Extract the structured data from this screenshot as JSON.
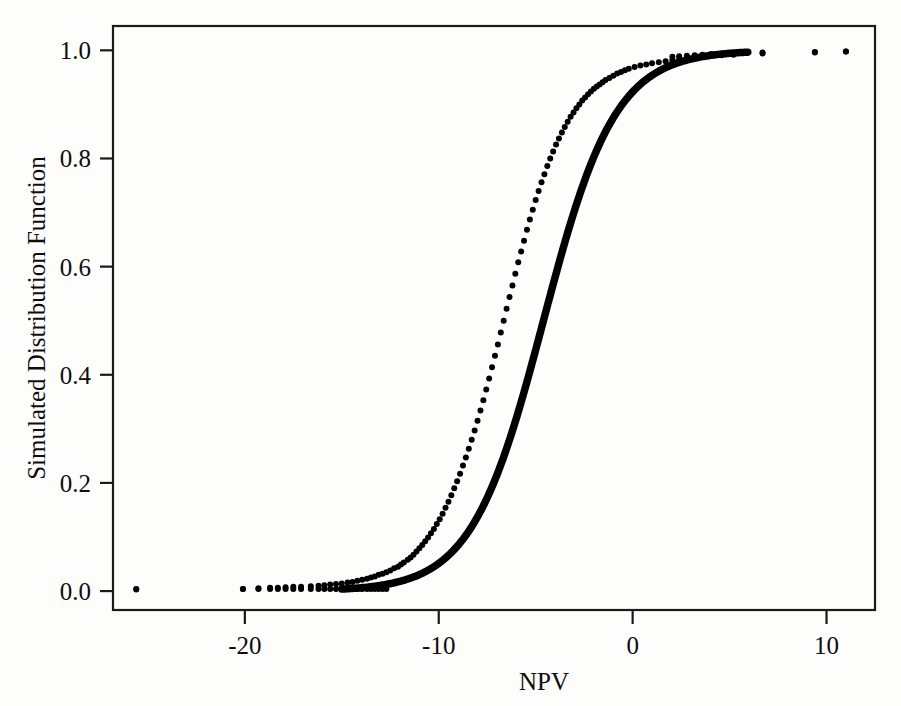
{
  "figure": {
    "background_color": "#fdfdfc",
    "ink_color": "#000000"
  },
  "chart_data": {
    "type": "scatter",
    "title": "",
    "subtitle": "",
    "xlabel": "NPV",
    "ylabel": "Simulated Distribution Function",
    "xlim": [
      -26.8,
      12.5
    ],
    "ylim": [
      -0.035,
      1.045
    ],
    "xticks": [
      -20,
      -10,
      0,
      10
    ],
    "xticklabels": [
      "-20",
      "-10",
      "0",
      "10"
    ],
    "yticks": [
      0.0,
      0.2,
      0.4,
      0.6,
      0.8,
      1.0
    ],
    "yticklabels": [
      "0.0",
      "0.2",
      "0.4",
      "0.6",
      "0.8",
      "1.0"
    ],
    "grid": false,
    "legend": null,
    "annotations": [],
    "marker": "dot",
    "marker_size_px": 6,
    "n_points_approx": 1000,
    "midpoint_npv": -4.6,
    "scale_npv": 1.85,
    "x": [
      -25.6,
      -20.1,
      -19.3,
      -18.7,
      -18.3,
      -17.9,
      -17.5,
      -17.1,
      -16.6,
      -16.2,
      -15.9,
      -15.6,
      -15.3,
      -15.0,
      -14.7,
      -14.45,
      -14.2,
      -13.95,
      -13.7,
      -13.5,
      -13.3,
      -13.1,
      -12.9,
      -12.7,
      -12.5,
      -12.3,
      -12.1,
      -11.95,
      -11.8,
      -11.6,
      -11.45,
      -11.3,
      -11.15,
      -11.0,
      -10.85,
      -10.7,
      -10.55,
      -10.4,
      -10.25,
      -10.1,
      -9.95,
      -9.8,
      -9.65,
      -9.5,
      -9.35,
      -9.2,
      -9.05,
      -8.9,
      -8.75,
      -8.6,
      -8.45,
      -8.3,
      -8.15,
      -8.0,
      -7.85,
      -7.7,
      -7.55,
      -7.4,
      -7.25,
      -7.1,
      -6.95,
      -6.8,
      -6.65,
      -6.5,
      -6.35,
      -6.2,
      -6.05,
      -5.9,
      -5.75,
      -5.6,
      -5.45,
      -5.3,
      -5.15,
      -5.0,
      -4.85,
      -4.7,
      -4.55,
      -4.4,
      -4.25,
      -4.1,
      -3.95,
      -3.8,
      -3.65,
      -3.5,
      -3.35,
      -3.2,
      -3.05,
      -2.9,
      -2.75,
      -2.6,
      -2.45,
      -2.3,
      -2.15,
      -2.0,
      -1.85,
      -1.7,
      -1.55,
      -1.4,
      -1.2,
      -1.0,
      -0.8,
      -0.6,
      -0.4,
      -0.2,
      0.1,
      0.4,
      0.7,
      1.0,
      1.35,
      1.7,
      2.05,
      2.4,
      2.8,
      3.2,
      3.6,
      4.05,
      4.6,
      5.2,
      6.7,
      9.4,
      11.0
    ],
    "y": [
      0.003,
      0.004,
      0.005,
      0.006,
      0.006,
      0.007,
      0.008,
      0.008,
      0.009,
      0.01,
      0.011,
      0.012,
      0.013,
      0.014,
      0.016,
      0.017,
      0.019,
      0.021,
      0.023,
      0.025,
      0.027,
      0.03,
      0.032,
      0.035,
      0.038,
      0.042,
      0.045,
      0.049,
      0.053,
      0.058,
      0.062,
      0.067,
      0.073,
      0.079,
      0.085,
      0.092,
      0.099,
      0.107,
      0.115,
      0.124,
      0.133,
      0.143,
      0.154,
      0.165,
      0.177,
      0.19,
      0.203,
      0.217,
      0.232,
      0.247,
      0.263,
      0.28,
      0.297,
      0.315,
      0.334,
      0.353,
      0.373,
      0.393,
      0.414,
      0.435,
      0.456,
      0.478,
      0.5,
      0.522,
      0.544,
      0.565,
      0.587,
      0.608,
      0.628,
      0.648,
      0.668,
      0.687,
      0.705,
      0.723,
      0.74,
      0.756,
      0.771,
      0.786,
      0.8,
      0.813,
      0.826,
      0.837,
      0.848,
      0.858,
      0.868,
      0.877,
      0.885,
      0.893,
      0.9,
      0.907,
      0.913,
      0.919,
      0.924,
      0.929,
      0.933,
      0.937,
      0.941,
      0.945,
      0.949,
      0.953,
      0.957,
      0.96,
      0.963,
      0.966,
      0.969,
      0.972,
      0.974,
      0.976,
      0.978,
      0.98,
      0.982,
      0.984,
      0.985,
      0.987,
      0.988,
      0.99,
      0.991,
      0.992,
      0.994,
      0.996,
      0.998
    ]
  }
}
